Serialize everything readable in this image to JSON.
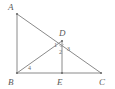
{
  "figure": {
    "background_color": "#ffffff",
    "line_color": "#8a8a8a",
    "label_color": "#5a5a5a",
    "vertices": [
      {
        "name": "A",
        "label": "A",
        "x": 17,
        "y": 14,
        "label_x": 8,
        "label_y": 10
      },
      {
        "name": "B",
        "label": "B",
        "x": 17,
        "y": 73,
        "label_x": 8,
        "label_y": 85
      },
      {
        "name": "C",
        "label": "C",
        "x": 101,
        "y": 73,
        "label_x": 99,
        "label_y": 85
      },
      {
        "name": "D",
        "label": "D",
        "x": 62,
        "y": 41,
        "label_x": 59,
        "label_y": 36
      },
      {
        "name": "E",
        "label": "E",
        "x": 62,
        "y": 73,
        "label_x": 57,
        "label_y": 85
      }
    ],
    "segments": [
      {
        "name": "segment-AB",
        "from": "A",
        "to": "B"
      },
      {
        "name": "segment-AC",
        "from": "A",
        "to": "C"
      },
      {
        "name": "segment-BC",
        "from": "B",
        "to": "C"
      },
      {
        "name": "segment-BD",
        "from": "B",
        "to": "D"
      },
      {
        "name": "segment-DE",
        "from": "D",
        "to": "E"
      }
    ],
    "angle_labels": [
      {
        "name": "angle-1",
        "label": "1",
        "x": 54,
        "y": 47
      },
      {
        "name": "angle-2",
        "label": "2",
        "x": 59,
        "y": 54
      },
      {
        "name": "angle-3",
        "label": "3",
        "x": 67,
        "y": 51
      },
      {
        "name": "angle-4",
        "label": "4",
        "x": 28,
        "y": 70
      }
    ],
    "right_angle_mark": {
      "name": "right-angle-mark-at-D",
      "at_vertex": "D",
      "visible": true
    }
  }
}
